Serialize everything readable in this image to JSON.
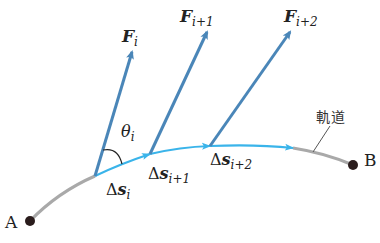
{
  "diagram": {
    "colors": {
      "force_arrow": "#4a86b8",
      "path_segment": "#3ab4ea",
      "trajectory": "#a9a9a9",
      "point": "#2a1c1c",
      "text": "#222222"
    },
    "points": {
      "start": {
        "label": "A"
      },
      "end": {
        "label": "B"
      }
    },
    "forces": [
      {
        "symbol": "F",
        "subscript": "i"
      },
      {
        "symbol": "F",
        "subscript": "i+1"
      },
      {
        "symbol": "F",
        "subscript": "i+2"
      }
    ],
    "displacements": [
      {
        "symbol": "Δs",
        "prefix": "Δ",
        "vector": "s",
        "subscript": "i"
      },
      {
        "symbol": "Δs",
        "prefix": "Δ",
        "vector": "s",
        "subscript": "i+1"
      },
      {
        "symbol": "Δs",
        "prefix": "Δ",
        "vector": "s",
        "subscript": "i+2"
      }
    ],
    "angle": {
      "symbol": "θ",
      "subscript": "i"
    },
    "trajectory_label": "軌道"
  }
}
